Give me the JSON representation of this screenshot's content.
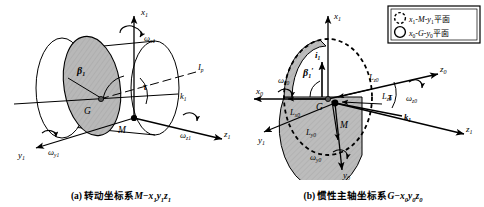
{
  "figure": {
    "type": "engineering-diagram"
  },
  "panel_a": {
    "id": "a",
    "caption_prefix": "(a)",
    "caption_text": "转动坐标系",
    "caption_system": "M−x",
    "caption_sub1": "1",
    "caption_y": "y",
    "caption_sub2": "1",
    "caption_z": "z",
    "caption_sub3": "1",
    "caption_full": "(a) 转动坐标系M−x₁y₁z₁",
    "axes": [
      {
        "name": "x1",
        "label": "x",
        "sub": "1",
        "direction": "up"
      },
      {
        "name": "y1",
        "label": "y",
        "sub": "1",
        "direction": "lower-left"
      },
      {
        "name": "z1",
        "label": "z",
        "sub": "1",
        "direction": "lower-right"
      }
    ],
    "omegas": [
      {
        "name": "omega-x1",
        "label": "ω",
        "sub": "x1"
      },
      {
        "name": "omega-y1",
        "label": "ω",
        "sub": "y1"
      },
      {
        "name": "omega-z1",
        "label": "ω",
        "sub": "z1"
      }
    ],
    "points": [
      {
        "name": "G",
        "label": "G",
        "role": "mass-center"
      },
      {
        "name": "M",
        "label": "M",
        "role": "geometric-center"
      }
    ],
    "angles": [
      {
        "name": "beta1",
        "label": "β",
        "sub": "1"
      },
      {
        "name": "tau",
        "label": "τ",
        "sub": ""
      }
    ],
    "vectors": [
      {
        "name": "k1",
        "label": "k",
        "sub": "1"
      },
      {
        "name": "Ip",
        "label": "I",
        "sub": "p"
      }
    ]
  },
  "panel_b": {
    "id": "b",
    "caption_prefix": "(b)",
    "caption_text": "惯性主轴坐标系",
    "caption_system": "G−x",
    "caption_sub1": "0",
    "caption_y": "y",
    "caption_sub2": "0",
    "caption_z": "z",
    "caption_sub3": "0",
    "caption_full": "(b) 惯性主轴坐标系G−x₀y₀z₀",
    "axes": [
      {
        "name": "x1",
        "label": "x",
        "sub": "1",
        "direction": "up"
      },
      {
        "name": "x0",
        "label": "x",
        "sub": "0",
        "direction": "left"
      },
      {
        "name": "y0",
        "label": "y",
        "sub": "0",
        "direction": "down"
      },
      {
        "name": "y1",
        "label": "y",
        "sub": "1",
        "direction": "lower-left"
      },
      {
        "name": "z0",
        "label": "z",
        "sub": "0",
        "direction": "upper-right"
      },
      {
        "name": "z1",
        "label": "z",
        "sub": "1",
        "direction": "lower-right"
      }
    ],
    "omegas": [
      {
        "name": "omega-x0",
        "label": "ω",
        "sub": "x0"
      },
      {
        "name": "omega-y0",
        "label": "ω",
        "sub": "y0"
      },
      {
        "name": "omega-z0",
        "label": "ω",
        "sub": "z0"
      }
    ],
    "points": [
      {
        "name": "G",
        "label": "G",
        "role": "mass-center"
      },
      {
        "name": "M",
        "label": "M",
        "role": "geometric-center"
      }
    ],
    "angles": [
      {
        "name": "beta1-prime",
        "label": "β",
        "sub": "1",
        "prime": "′"
      },
      {
        "name": "tau",
        "label": "τ",
        "sub": ""
      }
    ],
    "vectors": [
      {
        "name": "i1",
        "label": "i",
        "sub": "1"
      },
      {
        "name": "k1",
        "label": "k",
        "sub": "1"
      },
      {
        "name": "Lx0",
        "label": "L",
        "sub": "x0"
      },
      {
        "name": "Ly0",
        "label": "L",
        "sub": "y0"
      },
      {
        "name": "Lz0",
        "label": "L",
        "sub": "z0"
      },
      {
        "name": "Lz0b",
        "label": "L",
        "sub": "z0"
      }
    ]
  },
  "legend": {
    "name": "plane-legend",
    "items": [
      {
        "marker": "dashed-circle",
        "label": "x",
        "sub1": "1",
        "mid": "-M-y",
        "sub2": "1",
        "suffix": "平面",
        "full": "x₁-M-y₁平面"
      },
      {
        "marker": "solid-circle",
        "label": "x",
        "sub1": "0",
        "mid": "-G-y",
        "sub2": "0",
        "suffix": "平面",
        "full": "x₀-G-y₀平面"
      }
    ]
  },
  "colors": {
    "stroke": "#000000",
    "fill_shaded": "#b5b5b5",
    "fill_light": "#ffffff",
    "legend_border": "#000000",
    "background": "#ffffff"
  }
}
